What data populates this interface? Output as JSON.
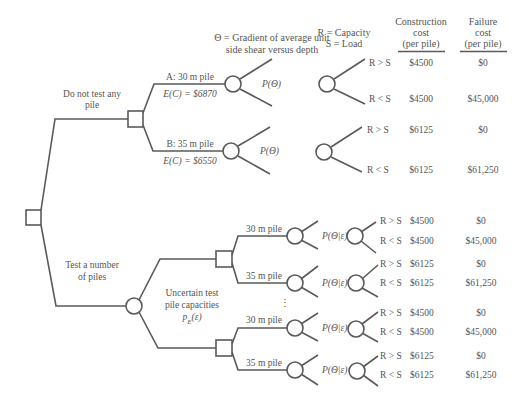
{
  "header": {
    "theta_def": [
      "Θ = Gradient of average unit",
      "side shear versus depth"
    ],
    "rs_def_r": "R = Capacity",
    "rs_def_s": "S = Load",
    "construction_cost": [
      "Construction",
      "cost",
      "(per pile)"
    ],
    "failure_cost": [
      "Failure",
      "cost",
      "(per pile)"
    ]
  },
  "no_test": {
    "label": [
      "Do not test any",
      "pile"
    ],
    "options": [
      {
        "name": "A: 30 m pile",
        "ec": "E(C) = $6870",
        "prob": "P(Θ)",
        "outcomes": [
          {
            "label": "R > S",
            "construction": "$4500",
            "failure": "$0"
          },
          {
            "label": "R < S",
            "construction": "$4500",
            "failure": "$45,000"
          }
        ]
      },
      {
        "name": "B: 35 m pile",
        "ec": "E(C) = $6550",
        "prob": "P(Θ)",
        "outcomes": [
          {
            "label": "R > S",
            "construction": "$6125",
            "failure": "$0"
          },
          {
            "label": "R < S",
            "construction": "$6125",
            "failure": "$61,250"
          }
        ]
      }
    ]
  },
  "test": {
    "label": [
      "Test a number",
      "of piles"
    ],
    "chance_label": [
      "Uncertain test",
      "pile capacities",
      "p_E(ε)"
    ],
    "ellipsis": "⋮",
    "groups": [
      {
        "options": [
          {
            "name": "30 m pile",
            "prob": "P(Θ|ε)",
            "outcomes": [
              {
                "label": "R > S",
                "construction": "$4500",
                "failure": "$0"
              },
              {
                "label": "R < S",
                "construction": "$4500",
                "failure": "$45,000"
              }
            ]
          },
          {
            "name": "35 m pile",
            "prob": "P(Θ|ε)",
            "outcomes": [
              {
                "label": "R > S",
                "construction": "$6125",
                "failure": "$0"
              },
              {
                "label": "R < S",
                "construction": "$6125",
                "failure": "$61,250"
              }
            ]
          }
        ]
      },
      {
        "options": [
          {
            "name": "30 m pile",
            "prob": "P(Θ|ε)",
            "outcomes": [
              {
                "label": "R > S",
                "construction": "$4500",
                "failure": "$0"
              },
              {
                "label": "R < S",
                "construction": "$4500",
                "failure": "$45,000"
              }
            ]
          },
          {
            "name": "35 m pile",
            "prob": "P(Θ|ε)",
            "outcomes": [
              {
                "label": "R > S",
                "construction": "$6125",
                "failure": "$0"
              },
              {
                "label": "R < S",
                "construction": "$6125",
                "failure": "$61,250"
              }
            ]
          }
        ]
      }
    ]
  }
}
